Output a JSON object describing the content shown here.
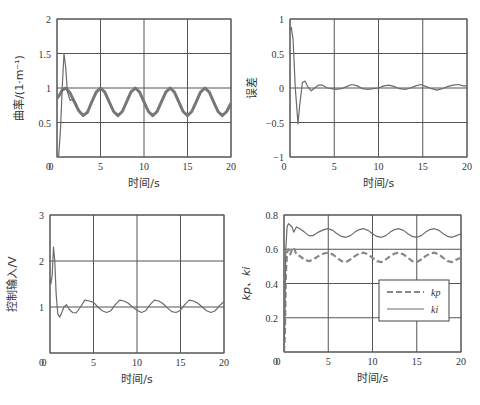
{
  "chart_data": [
    {
      "type": "line",
      "title": "",
      "xlabel": "时间/s",
      "ylabel": "曲率/(1·m⁻¹)",
      "xlim": [
        0,
        20
      ],
      "ylim": [
        0,
        2
      ],
      "xticks": [
        0,
        5,
        10,
        15,
        20
      ],
      "yticks": [
        0,
        0.5,
        1,
        1.5,
        2
      ],
      "ytick_labels": [
        "0",
        "0.5",
        "1",
        "1.5",
        "2"
      ],
      "grid": true,
      "box": {
        "left": 57,
        "top": 19,
        "right": 231,
        "bottom": 157
      },
      "series": [
        {
          "name": "reference",
          "style": "thick",
          "x": [
            0,
            0.3,
            0.6,
            1.0,
            1.5,
            2.0,
            2.5,
            3.0,
            3.5,
            4.0,
            4.5,
            5.0,
            5.5,
            6.0,
            6.5,
            7.0,
            7.5,
            8.0,
            8.5,
            9.0,
            9.5,
            10.0,
            10.5,
            11.0,
            11.5,
            12.0,
            12.5,
            13.0,
            13.5,
            14.0,
            14.5,
            15.0,
            15.5,
            16.0,
            16.5,
            17.0,
            17.5,
            18.0,
            18.5,
            19.0,
            19.5,
            20.0
          ],
          "y": [
            0.85,
            0.9,
            0.97,
            1.0,
            0.93,
            0.8,
            0.67,
            0.6,
            0.65,
            0.8,
            0.94,
            1.0,
            0.94,
            0.8,
            0.66,
            0.6,
            0.66,
            0.8,
            0.94,
            1.0,
            0.94,
            0.8,
            0.66,
            0.6,
            0.66,
            0.8,
            0.94,
            1.0,
            0.94,
            0.8,
            0.66,
            0.6,
            0.66,
            0.8,
            0.94,
            1.0,
            0.94,
            0.8,
            0.66,
            0.6,
            0.66,
            0.78
          ]
        },
        {
          "name": "response",
          "style": "thin",
          "x": [
            0,
            0.2,
            0.4,
            0.6,
            0.8,
            1.0,
            1.2,
            1.5,
            1.8,
            2.0,
            2.3
          ],
          "y": [
            0,
            0.02,
            0.4,
            1.0,
            1.5,
            1.3,
            0.95,
            0.82,
            0.83,
            0.8,
            0.75
          ]
        }
      ]
    },
    {
      "type": "line",
      "title": "",
      "xlabel": "时间/s",
      "ylabel": "误差",
      "xlim": [
        0,
        20
      ],
      "ylim": [
        -1,
        1
      ],
      "xticks": [
        0,
        5,
        10,
        15,
        20
      ],
      "yticks": [
        -1,
        -0.5,
        0,
        0.5,
        1
      ],
      "ytick_labels": [
        "−1",
        "−0.5",
        "0",
        "0.5",
        "1"
      ],
      "grid": true,
      "box": {
        "left": 290,
        "top": 19,
        "right": 467,
        "bottom": 157
      },
      "series": [
        {
          "name": "error",
          "style": "thin",
          "x": [
            0,
            0.15,
            0.35,
            0.6,
            0.9,
            1.1,
            1.4,
            1.7,
            2.0,
            2.4,
            2.8,
            3.2,
            3.7,
            4.2,
            4.7,
            5.2,
            5.8,
            6.4,
            7.0,
            7.6,
            8.2,
            8.8,
            9.4,
            10.0,
            10.6,
            11.2,
            11.8,
            12.4,
            13.0,
            13.6,
            14.2,
            14.8,
            15.4,
            16.0,
            16.6,
            17.2,
            17.8,
            18.4,
            19.0,
            19.6,
            20.0
          ],
          "y": [
            0.85,
            0.88,
            0.7,
            0.0,
            -0.52,
            -0.25,
            0.08,
            0.1,
            0.02,
            -0.04,
            0.0,
            0.04,
            0.04,
            0.0,
            -0.01,
            -0.02,
            -0.01,
            0.02,
            0.05,
            0.03,
            -0.01,
            -0.02,
            -0.01,
            0.0,
            0.03,
            0.04,
            0.02,
            -0.01,
            -0.02,
            0.0,
            0.03,
            0.05,
            0.02,
            -0.01,
            -0.03,
            -0.01,
            0.02,
            0.04,
            0.05,
            0.03,
            0.03
          ]
        }
      ]
    },
    {
      "type": "line",
      "title": "",
      "xlabel": "时间/s",
      "ylabel": "控制输入/V",
      "xlim": [
        0,
        20
      ],
      "ylim": [
        0,
        3
      ],
      "xticks": [
        0,
        5,
        10,
        15,
        20
      ],
      "yticks": [
        0,
        1,
        2,
        3
      ],
      "ytick_labels": [
        "0",
        "1",
        "2",
        "3"
      ],
      "grid": true,
      "box": {
        "left": 50,
        "top": 215,
        "right": 224,
        "bottom": 353
      },
      "series": [
        {
          "name": "control-input",
          "style": "thin",
          "x": [
            0,
            0.1,
            0.25,
            0.4,
            0.55,
            0.7,
            0.9,
            1.1,
            1.3,
            1.6,
            1.9,
            2.2,
            2.6,
            3.0,
            3.5,
            4.0,
            4.5,
            5.0,
            5.5,
            6.0,
            6.5,
            7.0,
            7.5,
            8.0,
            8.5,
            9.0,
            9.5,
            10.0,
            10.5,
            11.0,
            11.5,
            12.0,
            12.5,
            13.0,
            13.5,
            14.0,
            14.5,
            15.0,
            15.5,
            16.0,
            16.5,
            17.0,
            17.5,
            18.0,
            18.5,
            19.0,
            19.5,
            20.0
          ],
          "y": [
            1.6,
            1.5,
            1.7,
            2.3,
            2.0,
            1.3,
            0.85,
            0.78,
            0.85,
            1.0,
            1.05,
            0.95,
            0.88,
            0.87,
            1.0,
            1.15,
            1.13,
            1.1,
            1.0,
            0.92,
            0.88,
            0.92,
            1.05,
            1.15,
            1.13,
            1.08,
            1.0,
            0.93,
            0.88,
            0.92,
            1.05,
            1.15,
            1.13,
            1.07,
            0.98,
            0.9,
            0.88,
            0.93,
            1.05,
            1.15,
            1.13,
            1.08,
            1.0,
            0.92,
            0.88,
            0.92,
            1.03,
            1.12
          ]
        }
      ]
    },
    {
      "type": "line",
      "title": "",
      "xlabel": "时间/s",
      "ylabel": "kp、ki",
      "xlim": [
        0,
        20
      ],
      "ylim": [
        0,
        0.8
      ],
      "xticks": [
        0,
        5,
        10,
        15,
        20
      ],
      "yticks": [
        0,
        0.2,
        0.4,
        0.6,
        0.8
      ],
      "ytick_labels": [
        "0",
        "0.2",
        "0.4",
        "0.6",
        "0.8"
      ],
      "grid": true,
      "box": {
        "left": 284,
        "top": 215,
        "right": 461,
        "bottom": 352
      },
      "legend": {
        "position": "center-right",
        "entries": [
          "kp",
          "ki"
        ]
      },
      "series": [
        {
          "name": "kp",
          "style": "dashed",
          "x": [
            0,
            0.1,
            0.2,
            0.35,
            0.5,
            0.7,
            0.9,
            1.1,
            1.4,
            1.8,
            2.3,
            2.8,
            3.3,
            3.9,
            4.5,
            5.0,
            5.5,
            6.0,
            6.5,
            7.0,
            7.5,
            8.0,
            8.5,
            9.0,
            9.5,
            10.0,
            10.5,
            11.0,
            11.5,
            12.0,
            12.5,
            13.0,
            13.5,
            14.0,
            14.5,
            15.0,
            15.5,
            16.0,
            16.5,
            17.0,
            17.5,
            18.0,
            18.5,
            19.0,
            19.5,
            20.0
          ],
          "y": [
            0,
            0.1,
            0.45,
            0.58,
            0.6,
            0.57,
            0.6,
            0.61,
            0.57,
            0.56,
            0.54,
            0.53,
            0.54,
            0.56,
            0.575,
            0.58,
            0.57,
            0.55,
            0.53,
            0.525,
            0.54,
            0.56,
            0.575,
            0.58,
            0.57,
            0.55,
            0.53,
            0.525,
            0.54,
            0.56,
            0.575,
            0.58,
            0.57,
            0.55,
            0.53,
            0.525,
            0.54,
            0.56,
            0.575,
            0.58,
            0.57,
            0.55,
            0.53,
            0.525,
            0.54,
            0.55
          ]
        },
        {
          "name": "ki",
          "style": "solid",
          "x": [
            0,
            0.1,
            0.2,
            0.35,
            0.5,
            0.7,
            0.9,
            1.1,
            1.4,
            1.8,
            2.3,
            2.8,
            3.3,
            3.9,
            4.5,
            5.0,
            5.5,
            6.0,
            6.5,
            7.0,
            7.5,
            8.0,
            8.5,
            9.0,
            9.5,
            10.0,
            10.5,
            11.0,
            11.5,
            12.0,
            12.5,
            13.0,
            13.5,
            14.0,
            14.5,
            15.0,
            15.5,
            16.0,
            16.5,
            17.0,
            17.5,
            18.0,
            18.5,
            19.0,
            19.5,
            20.0
          ],
          "y": [
            0,
            0.2,
            0.6,
            0.73,
            0.75,
            0.74,
            0.73,
            0.7,
            0.73,
            0.72,
            0.7,
            0.68,
            0.68,
            0.7,
            0.715,
            0.72,
            0.71,
            0.69,
            0.675,
            0.67,
            0.68,
            0.7,
            0.715,
            0.72,
            0.71,
            0.69,
            0.675,
            0.67,
            0.68,
            0.7,
            0.715,
            0.72,
            0.71,
            0.69,
            0.675,
            0.67,
            0.68,
            0.7,
            0.715,
            0.72,
            0.71,
            0.69,
            0.675,
            0.67,
            0.68,
            0.69
          ]
        }
      ]
    }
  ]
}
